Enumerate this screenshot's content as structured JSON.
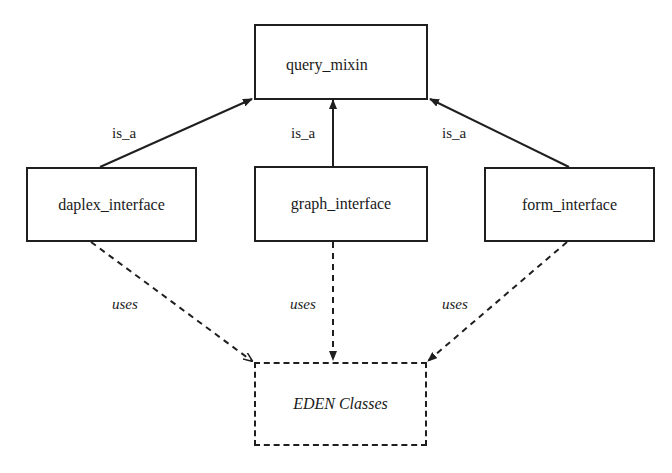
{
  "diagram": {
    "nodes": {
      "query_mixin": {
        "label": "query_mixin",
        "style": "solid"
      },
      "daplex_interface": {
        "label": "daplex_interface",
        "style": "solid"
      },
      "graph_interface": {
        "label": "graph_interface",
        "style": "solid"
      },
      "form_interface": {
        "label": "form_interface",
        "style": "solid"
      },
      "eden_classes": {
        "label": "EDEN Classes",
        "style": "dashed"
      }
    },
    "edges": [
      {
        "from": "daplex_interface",
        "to": "query_mixin",
        "label": "is_a",
        "style": "solid"
      },
      {
        "from": "graph_interface",
        "to": "query_mixin",
        "label": "is_a",
        "style": "solid"
      },
      {
        "from": "form_interface",
        "to": "query_mixin",
        "label": "is_a",
        "style": "solid"
      },
      {
        "from": "daplex_interface",
        "to": "eden_classes",
        "label": "uses",
        "style": "dashed"
      },
      {
        "from": "graph_interface",
        "to": "eden_classes",
        "label": "uses",
        "style": "dashed"
      },
      {
        "from": "form_interface",
        "to": "eden_classes",
        "label": "uses",
        "style": "dashed"
      }
    ],
    "colors": {
      "stroke": "#1f1f1f",
      "background": "#ffffff"
    }
  }
}
